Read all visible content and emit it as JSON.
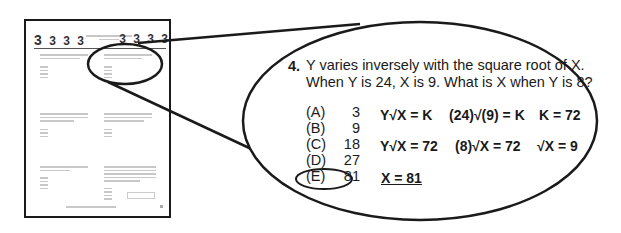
{
  "thumbnail": {
    "header_numbers_left": [
      "3",
      "3",
      "3",
      "3"
    ],
    "header_numbers_right": [
      "3",
      "3",
      "3",
      "3"
    ]
  },
  "question": {
    "number": "4.",
    "line1": "Y varies inversely with the square root of X.",
    "line2": "When Y is 24, X is 9.  What is X when Y is 8?",
    "choices": [
      {
        "label": "(A)",
        "value": "3"
      },
      {
        "label": "(B)",
        "value": "9"
      },
      {
        "label": "(C)",
        "value": "18"
      },
      {
        "label": "(D)",
        "value": "27"
      },
      {
        "label": "(E)",
        "value": "81"
      }
    ],
    "selected_choice": "E"
  },
  "work": {
    "row1": [
      "Y√X = K",
      "(24)√(9) = K",
      "K = 72"
    ],
    "row2": [
      "Y√X = 72",
      "(8)√X = 72",
      "√X = 9"
    ],
    "answer": "X = 81"
  }
}
